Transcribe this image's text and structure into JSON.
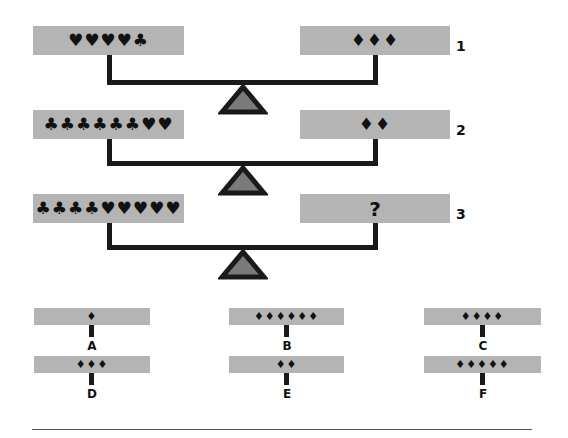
{
  "puzzle": {
    "scales": [
      {
        "number": "1",
        "left_pan": "♥♥♥♥♣",
        "right_pan": "♦♦♦"
      },
      {
        "number": "2",
        "left_pan": "♣♣♣♣♣♣♥♥",
        "right_pan": "♦♦"
      },
      {
        "number": "3",
        "left_pan": "♣♣♣♣♥♥♥♥♥",
        "right_pan": "?"
      }
    ],
    "options": [
      {
        "label": "A",
        "symbols": "♦"
      },
      {
        "label": "B",
        "symbols": "♦♦♦♦♦♦"
      },
      {
        "label": "C",
        "symbols": "♦♦♦♦"
      },
      {
        "label": "D",
        "symbols": "♦♦♦"
      },
      {
        "label": "E",
        "symbols": "♦♦"
      },
      {
        "label": "F",
        "symbols": "♦♦♦♦♦"
      }
    ]
  },
  "colors": {
    "pan": "#b4b4b4",
    "beam": "#1a1a1a",
    "fulcrum_fill": "#7a7a7a"
  }
}
